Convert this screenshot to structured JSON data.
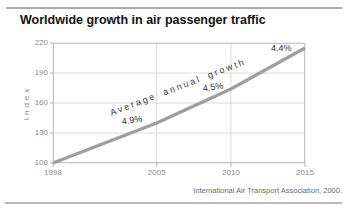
{
  "header": {
    "title": "Worldwide growth in air passenger traffic"
  },
  "footer": {
    "source": "International Air Transport Association, 2000."
  },
  "chart_data": {
    "type": "line",
    "title": "Worldwide growth in air passenger traffic",
    "xlabel": "",
    "ylabel": "Index",
    "x": [
      1998,
      2005,
      2010,
      2015
    ],
    "y": [
      100,
      140,
      174,
      215
    ],
    "xlim": [
      1998,
      2015
    ],
    "ylim": [
      100,
      220
    ],
    "x_ticks": [
      1998,
      2005,
      2010,
      2015
    ],
    "y_ticks": [
      100,
      130,
      160,
      190,
      220
    ],
    "grid": true,
    "legend": false,
    "line_color": "#9e9e9e",
    "grid_color": "#dadada",
    "border_color": "#c6c6c6",
    "annotations": [
      {
        "text": "Average annual growth",
        "x": 2006.4,
        "y": 176,
        "rotate": -21,
        "spaced": true
      },
      {
        "text": "4.9%",
        "x": 2003.3,
        "y": 143,
        "rotate": -8,
        "spaced": false
      },
      {
        "text": "4.5%",
        "x": 2008.8,
        "y": 176,
        "rotate": -8,
        "spaced": false
      },
      {
        "text": "4.4%",
        "x": 2013.4,
        "y": 215,
        "rotate": 0,
        "spaced": false
      }
    ],
    "source": "International Air Transport Association, 2000."
  }
}
